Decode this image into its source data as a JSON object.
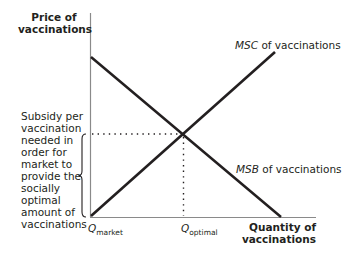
{
  "diagram": {
    "type": "subsidy-externality-diagram",
    "y_axis_label_line1": "Price of",
    "y_axis_label_line2": "vaccinations",
    "x_axis_label_line1": "Quantity of",
    "x_axis_label_line2": "vaccinations",
    "curves": {
      "msc": {
        "abbr": "MSC",
        "suffix": " of vaccinations",
        "direction": "upward-sloping"
      },
      "msb": {
        "abbr": "MSB",
        "suffix": " of vaccinations",
        "direction": "downward-sloping"
      }
    },
    "x_ticks": {
      "q_market": {
        "symbol": "Q",
        "sub": "market"
      },
      "q_optimal": {
        "symbol": "Q",
        "sub": "optimal"
      }
    },
    "annotation": {
      "lines": [
        "Subsidy per",
        "vaccination",
        "needed in",
        "order for",
        "market to",
        "provide the",
        "socially",
        "optimal",
        "amount of",
        "vaccinations"
      ]
    },
    "colors": {
      "ink": "#231f20",
      "axis": "#8a8a8a",
      "background": "#ffffff"
    }
  }
}
